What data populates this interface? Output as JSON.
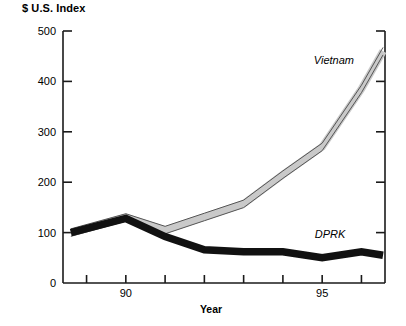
{
  "chart_data": {
    "type": "line",
    "title": "",
    "ylabel": "$ U.S. Index",
    "xlabel": "Year",
    "ylim": [
      0,
      500
    ],
    "xlim": [
      1988.4,
      1996.6
    ],
    "grid": false,
    "legend_position": "inline-end-of-line",
    "yticks": [
      0,
      100,
      200,
      300,
      400,
      500
    ],
    "ytick_labels": [
      "0",
      "100",
      "200",
      "300",
      "400",
      "500"
    ],
    "xticks": [
      1989,
      1990,
      1991,
      1992,
      1993,
      1994,
      1995,
      1996
    ],
    "xtick_labels": [
      "",
      "90",
      "",
      "",
      "",
      "",
      "95",
      ""
    ],
    "series": [
      {
        "name": "Vietnam",
        "color": "#c9c9c9",
        "edge_color": "#555555",
        "x": [
          1988.6,
          1990,
          1991,
          1992,
          1993,
          1994,
          1995,
          1996,
          1996.55
        ],
        "values": [
          100,
          130,
          105,
          131,
          157,
          215,
          270,
          385,
          460
        ]
      },
      {
        "name": "DPRK",
        "color": "#111111",
        "edge_color": "#111111",
        "x": [
          1988.6,
          1990,
          1991,
          1992,
          1993,
          1994,
          1995,
          1996,
          1996.55
        ],
        "values": [
          100,
          128,
          92,
          66,
          62,
          62,
          50,
          62,
          55
        ]
      }
    ],
    "annotations": [
      {
        "text": "Vietnam",
        "x": 1995.3,
        "y": 440
      },
      {
        "text": "DPRK",
        "x": 1995.2,
        "y": 96
      }
    ]
  }
}
